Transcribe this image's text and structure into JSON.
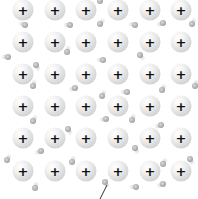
{
  "diagram": {
    "title": "",
    "ion_label": "+",
    "colors": {
      "ion_light": "#f2f2f2",
      "ion_dark": "#bdbdbd",
      "plus": "#111111",
      "electron": "#8a8a8a",
      "background": "#ffffff",
      "pointer": "#333333"
    },
    "ion_columns_x": [
      23,
      55,
      86,
      118,
      150,
      181
    ],
    "ion_rows_y": [
      10,
      42,
      74,
      106,
      138,
      171
    ],
    "electrons": [
      {
        "x": 100,
        "y": 1,
        "angle": 90
      },
      {
        "x": 25,
        "y": 25,
        "angle": 20
      },
      {
        "x": 70,
        "y": 25,
        "angle": 0
      },
      {
        "x": 100,
        "y": 24,
        "angle": 130
      },
      {
        "x": 135,
        "y": 25,
        "angle": 10
      },
      {
        "x": 163,
        "y": 23,
        "angle": -20
      },
      {
        "x": 192,
        "y": 24,
        "angle": 120
      },
      {
        "x": 8,
        "y": 57,
        "angle": 0
      },
      {
        "x": 36,
        "y": 65,
        "angle": -120
      },
      {
        "x": 67,
        "y": 52,
        "angle": 110
      },
      {
        "x": 103,
        "y": 60,
        "angle": 0
      },
      {
        "x": 140,
        "y": 55,
        "angle": -130
      },
      {
        "x": 33,
        "y": 86,
        "angle": 110
      },
      {
        "x": 75,
        "y": 88,
        "angle": -20
      },
      {
        "x": 102,
        "y": 96,
        "angle": 120
      },
      {
        "x": 127,
        "y": 92,
        "angle": 0
      },
      {
        "x": 162,
        "y": 90,
        "angle": 120
      },
      {
        "x": 195,
        "y": 86,
        "angle": 110
      },
      {
        "x": 33,
        "y": 121,
        "angle": 120
      },
      {
        "x": 68,
        "y": 129,
        "angle": -120
      },
      {
        "x": 106,
        "y": 119,
        "angle": -10
      },
      {
        "x": 132,
        "y": 120,
        "angle": 110
      },
      {
        "x": 161,
        "y": 125,
        "angle": -20
      },
      {
        "x": 7,
        "y": 160,
        "angle": 120
      },
      {
        "x": 41,
        "y": 151,
        "angle": -20
      },
      {
        "x": 72,
        "y": 162,
        "angle": 110
      },
      {
        "x": 135,
        "y": 148,
        "angle": -120
      },
      {
        "x": 163,
        "y": 164,
        "angle": 120
      },
      {
        "x": 190,
        "y": 159,
        "angle": -120
      },
      {
        "x": 35,
        "y": 188,
        "angle": 110
      },
      {
        "x": 105,
        "y": 182,
        "angle": -120
      },
      {
        "x": 136,
        "y": 187,
        "angle": 0
      },
      {
        "x": 163,
        "y": 184,
        "angle": -20
      }
    ],
    "pointer_line": {
      "x1": 107,
      "y1": 185,
      "x2": 100,
      "y2": 199
    }
  }
}
